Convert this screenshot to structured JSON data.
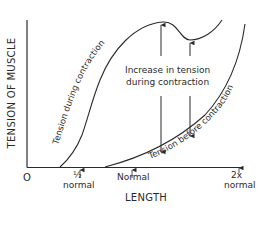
{
  "figure": {
    "y_axis_label": "TENSION OF MUSCLE",
    "x_axis_label": "LENGTH",
    "origin_label": "O",
    "x_ticks": [
      {
        "label_top": "½",
        "label_bottom": "normal",
        "position": "half-normal"
      },
      {
        "label_top": "Normal",
        "label_bottom": "",
        "position": "normal"
      },
      {
        "label_top": "2x",
        "label_bottom": "normal",
        "position": "double-normal"
      }
    ],
    "curves": [
      {
        "name": "active",
        "label": "Tension during contraction"
      },
      {
        "name": "passive",
        "label": "Tension before contraction"
      }
    ],
    "annotation": {
      "line1": "Increase in tension",
      "line2": "during contraction"
    },
    "colors": {
      "ink": "#2a2a2a",
      "background": "#ffffff"
    }
  }
}
